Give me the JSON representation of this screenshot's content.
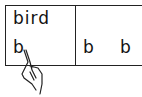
{
  "card": {
    "word": "bird",
    "left_letter": "b",
    "right_letters": [
      "b",
      "b"
    ]
  },
  "icons": {
    "pointer": "pointing-hand-icon"
  }
}
